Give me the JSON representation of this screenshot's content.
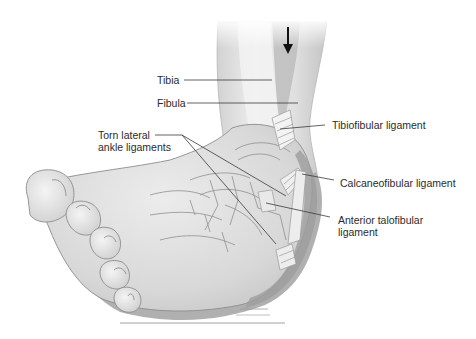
{
  "diagram": {
    "force_arrow": {
      "direction": "down",
      "icon": "arrow-down-icon"
    },
    "labels": {
      "tibia": "Tibia",
      "fibula": "Fibula",
      "torn_line1": "Torn lateral",
      "torn_line2": "ankle ligaments",
      "tibiofibular": "Tibiofibular ligament",
      "calcaneofibular": "Calcaneofibular ligament",
      "anterior_line1": "Anterior talofibular",
      "anterior_line2": "ligament"
    },
    "colors": {
      "background": "#ffffff",
      "skin_light": "#e6e6e6",
      "skin_mid": "#cfcfcf",
      "skin_dark": "#a9a9a9",
      "bone_outline": "#8c8c8c",
      "leader_line": "#3a3a3a",
      "text": "#2b2b2b"
    }
  }
}
